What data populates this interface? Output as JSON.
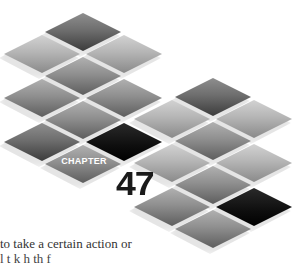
{
  "chapter": {
    "label": "CHAPTER",
    "number": "47"
  },
  "body_text": {
    "line1": "to take a certain action or",
    "line2": "l    t    k  h  th    f"
  },
  "colors": {
    "background": "#ffffff",
    "tile_light": "#b5b5b5",
    "tile_mid": "#8f8f8f",
    "tile_dark": "#6e6e6e",
    "tile_black": "#0e0e0e",
    "number_color": "#1a1a1a"
  },
  "tiles": [
    {
      "x": 83,
      "y": 32,
      "tone": "dark"
    },
    {
      "x": 42,
      "y": 54,
      "tone": "light"
    },
    {
      "x": 124,
      "y": 54,
      "tone": "light"
    },
    {
      "x": 83,
      "y": 76,
      "tone": "mid"
    },
    {
      "x": 42,
      "y": 98,
      "tone": "mid"
    },
    {
      "x": 124,
      "y": 98,
      "tone": "mid"
    },
    {
      "x": 213,
      "y": 97,
      "tone": "dark"
    },
    {
      "x": 83,
      "y": 120,
      "tone": "mid"
    },
    {
      "x": 172,
      "y": 119,
      "tone": "light"
    },
    {
      "x": 254,
      "y": 119,
      "tone": "light"
    },
    {
      "x": 42,
      "y": 142,
      "tone": "dark"
    },
    {
      "x": 124,
      "y": 142,
      "tone": "black"
    },
    {
      "x": 213,
      "y": 141,
      "tone": "mid"
    },
    {
      "x": 83,
      "y": 164,
      "tone": "mid"
    },
    {
      "x": 172,
      "y": 163,
      "tone": "light"
    },
    {
      "x": 254,
      "y": 163,
      "tone": "light"
    },
    {
      "x": 213,
      "y": 185,
      "tone": "mid"
    },
    {
      "x": 172,
      "y": 207,
      "tone": "mid"
    },
    {
      "x": 254,
      "y": 207,
      "tone": "black"
    },
    {
      "x": 213,
      "y": 229,
      "tone": "mid"
    }
  ]
}
